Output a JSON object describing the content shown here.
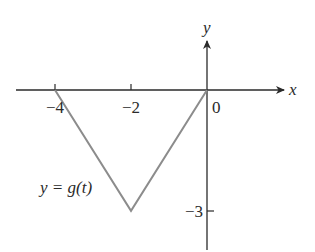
{
  "chart_data": {
    "type": "line",
    "title": "",
    "xlabel": "x",
    "ylabel": "y",
    "curve_label": "y = g(t)",
    "series": [
      {
        "name": "y = g(t)",
        "color": "#8c8c8c",
        "x": [
          -4,
          -2,
          0
        ],
        "y": [
          0,
          -3,
          0
        ]
      }
    ],
    "x_ticks": [
      {
        "value": -4,
        "label": "−4"
      },
      {
        "value": -2,
        "label": "−2"
      }
    ],
    "y_ticks": [
      {
        "value": -3,
        "label": "−3"
      }
    ],
    "origin_label": "0",
    "xlim": [
      -5,
      2
    ],
    "ylim": [
      -4,
      1.3
    ],
    "grid": false,
    "legend": "none"
  },
  "layout": {
    "origin_px": [
      207,
      90
    ],
    "px_per_unit_x": 38,
    "px_per_unit_y": 40.3,
    "axis_color": "#2a2a2a"
  }
}
